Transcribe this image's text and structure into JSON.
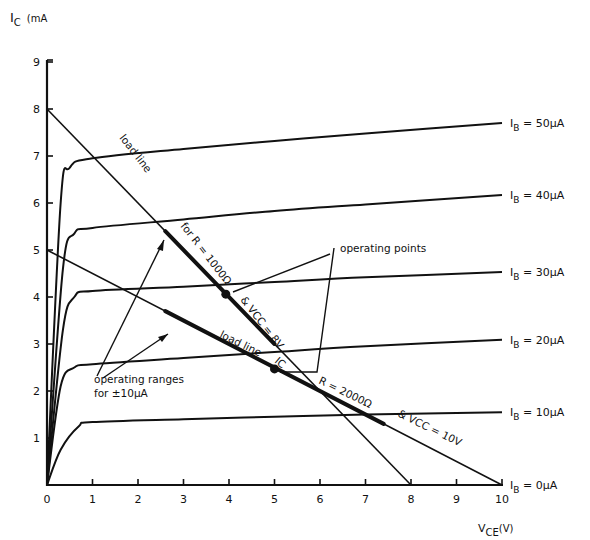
{
  "chart_data": {
    "type": "line",
    "title": "",
    "xlabel": "VCE(V)",
    "ylabel": "IC (mA)",
    "xlim": [
      0,
      10
    ],
    "ylim": [
      0,
      9
    ],
    "x_ticks": [
      "0",
      "1",
      "2",
      "3",
      "4",
      "5",
      "6",
      "7",
      "8",
      "9",
      "10"
    ],
    "y_ticks": [
      "1",
      "2",
      "3",
      "4",
      "5",
      "6",
      "7",
      "8",
      "9"
    ],
    "grid": false,
    "legend_position": "right-inline",
    "series": [
      {
        "name": "IB = 50µA",
        "label": "I_B = 50µA",
        "x": [
          0,
          0.3,
          0.5,
          1,
          3,
          5,
          7,
          10
        ],
        "y": [
          0,
          6.0,
          6.75,
          6.95,
          7.15,
          7.32,
          7.48,
          7.7
        ]
      },
      {
        "name": "IB = 40µA",
        "label": "I_B = 40µA",
        "x": [
          0,
          0.35,
          0.6,
          1,
          3,
          5,
          7,
          10
        ],
        "y": [
          0,
          4.6,
          5.35,
          5.47,
          5.65,
          5.83,
          5.97,
          6.17
        ]
      },
      {
        "name": "IB = 30µA",
        "label": "I_B = 30µA",
        "x": [
          0,
          0.35,
          0.6,
          1,
          3,
          5,
          7,
          10
        ],
        "y": [
          0,
          3.3,
          4.0,
          4.13,
          4.22,
          4.32,
          4.42,
          4.53
        ]
      },
      {
        "name": "IB = 20µA",
        "label": "I_B = 20µA",
        "x": [
          0,
          0.3,
          0.6,
          1,
          3,
          5,
          7,
          10
        ],
        "y": [
          0,
          2.1,
          2.5,
          2.57,
          2.7,
          2.83,
          2.95,
          3.09
        ]
      },
      {
        "name": "IB = 10µA",
        "label": "I_B = 10µA",
        "x": [
          0,
          0.3,
          0.7,
          1,
          3,
          5,
          7,
          10
        ],
        "y": [
          0,
          0.75,
          1.25,
          1.34,
          1.4,
          1.45,
          1.5,
          1.55
        ]
      },
      {
        "name": "IB = 0µA",
        "label": "I_B = 0µA",
        "x": [
          0,
          10
        ],
        "y": [
          0,
          0
        ]
      }
    ],
    "load_lines": [
      {
        "name": "load line R = 1000Ω, VCC = 8V",
        "x": [
          0,
          8
        ],
        "y": [
          8,
          0
        ],
        "operating_range": {
          "x": [
            2.6,
            5.0
          ],
          "y": [
            5.4,
            3.0
          ]
        }
      },
      {
        "name": "load line R = 2000Ω, VCC = 10V",
        "x": [
          0,
          10
        ],
        "y": [
          5,
          0
        ],
        "operating_range": {
          "x": [
            2.6,
            7.4
          ],
          "y": [
            3.7,
            1.3
          ]
        }
      }
    ],
    "operating_points": [
      {
        "x": 3.93,
        "y": 4.06,
        "load_line": "R = 1000Ω, VCC = 8V"
      },
      {
        "x": 5.0,
        "y": 2.47,
        "load_line": "R = 2000Ω, VCC = 10V"
      }
    ],
    "annotations": [
      "load line",
      "for R = 1000Ω & VCC = 8V",
      "load line",
      "R = 2000Ω",
      "& VCC = 10V",
      "operating points",
      "operating ranges for ±10µA",
      "IC"
    ]
  },
  "axes": {
    "ylabel_main": "I",
    "ylabel_sub": "C",
    "ylabel_unit": "(mA",
    "xlabel_main": "V",
    "xlabel_sub": "CE",
    "xlabel_unit": "(V)"
  },
  "labels": {
    "load_line_1": "load line",
    "load_line_1_params_a": "for R = 1000Ω",
    "load_line_1_params_b": "& VCC = 8V",
    "load_line_2": "load line",
    "load_line_2_params_a": "R = 2000Ω",
    "load_line_2_params_b": "& VCC = 10V",
    "operating_points": "operating points",
    "operating_ranges_1": "operating ranges",
    "operating_ranges_2": "for ±10µA",
    "ic_box": "IC"
  }
}
